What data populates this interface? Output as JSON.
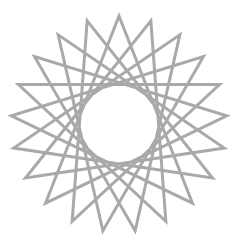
{
  "figure": {
    "type": "star-polygon",
    "points": 21,
    "step": 8,
    "center": [
      119,
      124
    ],
    "radius": 108,
    "start_angle_deg": -90,
    "stroke_color": "#a9a9a9",
    "stroke_width": 3,
    "background": "#ffffff"
  }
}
